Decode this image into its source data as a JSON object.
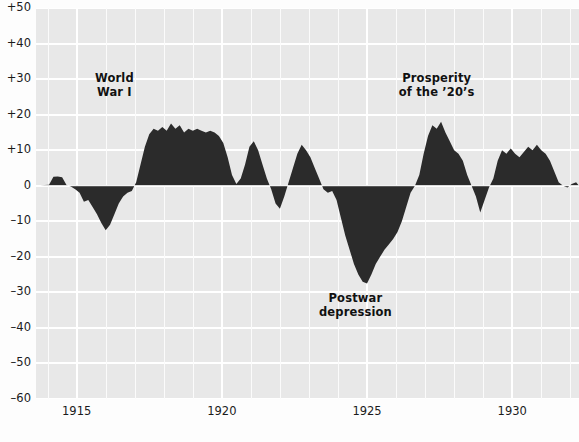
{
  "chart_data": {
    "type": "area",
    "title": "",
    "subtitle": "",
    "xlabel": "",
    "ylabel": "",
    "xlim": [
      1913.6,
      1932.3
    ],
    "ylim": [
      -60,
      50
    ],
    "grid": true,
    "legend": null,
    "zero_reference": 0,
    "y_ticks": [
      50,
      40,
      30,
      20,
      10,
      0,
      -10,
      -20,
      -30,
      -40,
      -50,
      -60
    ],
    "y_tick_labels": [
      "+50",
      "+40",
      "+30",
      "+20",
      "+10",
      "0",
      "–10",
      "–20",
      "–30",
      "–40",
      "–50",
      "–60"
    ],
    "x_ticks": [
      1915,
      1920,
      1925,
      1930
    ],
    "x_tick_labels": [
      "1915",
      "1920",
      "1925",
      "1930"
    ],
    "x_minor_tick_step": 1,
    "series_name": "Index deviation",
    "fill_color": "#2b2b2b",
    "plot_background": "#e8e8e8",
    "gridline_color": "#ffffff",
    "x": [
      1913.6,
      1913.75,
      1913.9,
      1914.05,
      1914.2,
      1914.35,
      1914.5,
      1914.65,
      1914.8,
      1914.95,
      1915.1,
      1915.25,
      1915.4,
      1915.55,
      1915.7,
      1915.85,
      1916.0,
      1916.15,
      1916.3,
      1916.45,
      1916.6,
      1916.75,
      1916.9,
      1917.05,
      1917.2,
      1917.35,
      1917.5,
      1917.65,
      1917.8,
      1917.95,
      1918.1,
      1918.25,
      1918.4,
      1918.55,
      1918.7,
      1918.85,
      1919.0,
      1919.15,
      1919.3,
      1919.45,
      1919.6,
      1919.75,
      1919.9,
      1920.05,
      1920.2,
      1920.35,
      1920.5,
      1920.65,
      1920.8,
      1920.95,
      1921.1,
      1921.25,
      1921.4,
      1921.55,
      1921.7,
      1921.85,
      1922.0,
      1922.15,
      1922.3,
      1922.45,
      1922.6,
      1922.75,
      1922.9,
      1923.05,
      1923.2,
      1923.35,
      1923.5,
      1923.65,
      1923.8,
      1923.95,
      1924.1,
      1924.25,
      1924.4,
      1924.55,
      1924.7,
      1924.85,
      1925.0,
      1925.15,
      1925.3,
      1925.45,
      1925.6,
      1925.75,
      1925.9,
      1926.05,
      1926.2,
      1926.35,
      1926.5,
      1926.65,
      1926.8,
      1926.95,
      1927.1,
      1927.25,
      1927.4,
      1927.55,
      1927.7,
      1927.85,
      1928.0,
      1928.15,
      1928.3,
      1928.45,
      1928.6,
      1928.75,
      1928.9,
      1929.05,
      1929.2,
      1929.35,
      1929.5,
      1929.65,
      1929.8,
      1929.95,
      1930.1,
      1930.25,
      1930.4,
      1930.55,
      1930.7,
      1930.85,
      1931.0,
      1931.15,
      1931.3,
      1931.45,
      1931.6,
      1931.75,
      1931.9,
      1932.05,
      1932.2,
      1932.3
    ],
    "y": [
      0.0,
      0.0,
      0.2,
      0.3,
      2.5,
      2.6,
      2.4,
      0.2,
      -0.2,
      -1.0,
      -2.0,
      -4.5,
      -4.0,
      -6.0,
      -8.0,
      -10.5,
      -12.5,
      -11.0,
      -8.0,
      -5.0,
      -3.0,
      -2.0,
      -1.5,
      1.0,
      6.0,
      11.0,
      14.5,
      16.0,
      15.5,
      16.5,
      15.5,
      17.5,
      16.0,
      17.0,
      15.0,
      16.0,
      15.5,
      16.0,
      15.5,
      15.0,
      15.5,
      15.0,
      14.0,
      12.0,
      8.0,
      3.0,
      0.5,
      2.0,
      6.0,
      11.0,
      12.5,
      10.0,
      6.0,
      2.0,
      -1.0,
      -5.0,
      -6.5,
      -3.0,
      1.0,
      5.0,
      9.0,
      11.5,
      10.0,
      8.0,
      5.0,
      2.0,
      -1.0,
      -2.0,
      -1.5,
      -4.0,
      -9.0,
      -14.0,
      -18.0,
      -22.0,
      -25.0,
      -27.0,
      -27.5,
      -25.0,
      -22.0,
      -20.0,
      -18.0,
      -16.5,
      -15.0,
      -13.0,
      -10.0,
      -6.0,
      -2.0,
      0.0,
      3.0,
      9.0,
      14.0,
      17.0,
      16.0,
      18.0,
      15.0,
      12.5,
      10.0,
      9.0,
      7.0,
      3.0,
      0.0,
      -3.0,
      -7.5,
      -4.0,
      -0.5,
      2.0,
      7.0,
      10.0,
      9.0,
      10.5,
      9.0,
      8.0,
      9.5,
      11.0,
      10.0,
      11.5,
      10.0,
      9.0,
      7.0,
      4.0,
      1.0,
      0.0,
      -0.5,
      0.5,
      1.0,
      0.0
    ],
    "annotations": [
      {
        "id": "world-war-i",
        "text": "World\nWar I",
        "x": 1916.3,
        "y": 30,
        "align": "center"
      },
      {
        "id": "postwar-depression",
        "text": "Postwar\ndepression",
        "x": 1924.6,
        "y": -32,
        "align": "center"
      },
      {
        "id": "prosperity-twenties",
        "text": "Prosperity\nof the ’20’s",
        "x": 1927.4,
        "y": 30,
        "align": "center"
      }
    ]
  }
}
